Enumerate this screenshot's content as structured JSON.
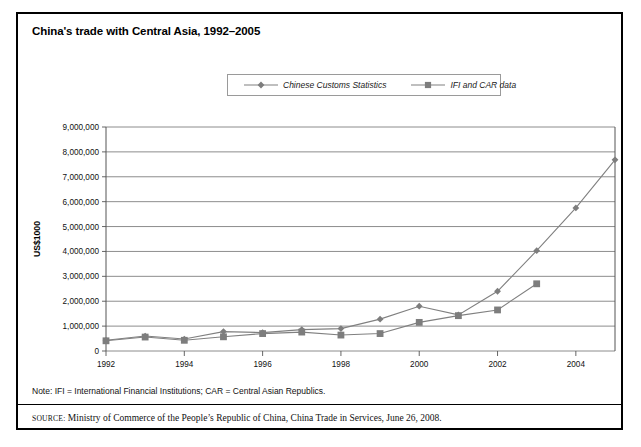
{
  "figure": {
    "title": "China's trade with Central Asia, 1992–2005",
    "note": "Note: IFI = International Financial Institutions; CAR = Central Asian Republics.",
    "source_lead": "source:",
    "source_text": "Ministry of Commerce of the People’s Republic of China, China Trade in Services, June 26, 2008."
  },
  "colors": {
    "series_line": "#808080",
    "marker": "#7d7d7d",
    "gridline": "#808080",
    "axis": "#555555",
    "frame": "#000000"
  },
  "chart_data": {
    "type": "line",
    "title": "China's trade with Central Asia, 1992–2005",
    "xlabel": "Year",
    "ylabel": "US$1000",
    "xlim": [
      1992,
      2005
    ],
    "ylim": [
      0,
      9000000
    ],
    "ytick_step": 1000000,
    "yticks": [
      0,
      1000000,
      2000000,
      3000000,
      4000000,
      5000000,
      6000000,
      7000000,
      8000000,
      9000000
    ],
    "ytick_labels": [
      "0",
      "1,000,000",
      "2,000,000",
      "3,000,000",
      "4,000,000",
      "5,000,000",
      "6,000,000",
      "7,000,000",
      "8,000,000",
      "9,000,000"
    ],
    "x": [
      1992,
      1993,
      1994,
      1995,
      1996,
      1997,
      1998,
      1999,
      2000,
      2001,
      2002,
      2003,
      2004,
      2005
    ],
    "xtick_labels": [
      "1992",
      "",
      "1994",
      "",
      "1996",
      "",
      "1998",
      "",
      "2000",
      "",
      "2002",
      "",
      "2004",
      ""
    ],
    "grid": true,
    "legend_position": "top-center",
    "series": [
      {
        "name": "Chinese Customs Statistics",
        "marker": "diamond",
        "values": [
          430000,
          600000,
          480000,
          780000,
          740000,
          860000,
          900000,
          1280000,
          1800000,
          1450000,
          2400000,
          4030000,
          5750000,
          7680000
        ]
      },
      {
        "name": "IFI and CAR data",
        "marker": "square",
        "values": [
          410000,
          560000,
          430000,
          570000,
          700000,
          760000,
          640000,
          700000,
          1150000,
          1420000,
          1650000,
          2700000,
          null,
          null
        ]
      }
    ]
  }
}
